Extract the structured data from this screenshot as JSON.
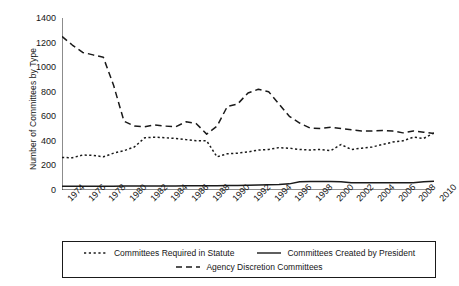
{
  "chart_data": {
    "type": "line",
    "title": "",
    "xlabel": "",
    "ylabel": "Number of Committees by Type",
    "ylim": [
      0,
      1400
    ],
    "ytick_step": 200,
    "yticks": [
      0,
      200,
      400,
      600,
      800,
      1000,
      1200,
      1400
    ],
    "xlim": [
      1974,
      2010
    ],
    "x": [
      1974,
      1975,
      1976,
      1977,
      1978,
      1979,
      1980,
      1981,
      1982,
      1983,
      1984,
      1985,
      1986,
      1987,
      1988,
      1989,
      1990,
      1991,
      1992,
      1993,
      1994,
      1995,
      1996,
      1997,
      1998,
      1999,
      2000,
      2001,
      2002,
      2003,
      2004,
      2005,
      2006,
      2007,
      2008,
      2009,
      2010
    ],
    "xtick_labels": [
      "1974",
      "1976",
      "1978",
      "1980",
      "1982",
      "1984",
      "1986",
      "1988",
      "1990",
      "1992",
      "1994",
      "1996",
      "1998",
      "2000",
      "2002",
      "2004",
      "2006",
      "2008",
      "2010"
    ],
    "xtick_label_years": [
      1974,
      1976,
      1978,
      1980,
      1982,
      1984,
      1986,
      1988,
      1990,
      1992,
      1994,
      1996,
      1998,
      2000,
      2002,
      2004,
      2006,
      2008,
      2010
    ],
    "xtick_minor_years": [
      1974,
      1975,
      1976,
      1977,
      1978,
      1979,
      1980,
      1981,
      1982,
      1983,
      1984,
      1985,
      1986,
      1987,
      1988,
      1989,
      1990,
      1991,
      1992,
      1993,
      1994,
      1995,
      1996,
      1997,
      1998,
      1999,
      2000,
      2001,
      2002,
      2003,
      2004,
      2005,
      2006,
      2007,
      2008,
      2009,
      2010
    ],
    "grid": false,
    "legend_position": "below",
    "series": [
      {
        "name": "Committees Required in Statute",
        "style": "dotted",
        "color": "#1a1a1a",
        "values": [
          265,
          262,
          285,
          282,
          270,
          300,
          320,
          350,
          425,
          430,
          425,
          420,
          410,
          400,
          400,
          270,
          295,
          300,
          310,
          325,
          330,
          345,
          340,
          330,
          325,
          330,
          320,
          370,
          330,
          340,
          350,
          370,
          390,
          400,
          430,
          420,
          465
        ]
      },
      {
        "name": "Committees Created by President",
        "style": "solid",
        "color": "#1a1a1a",
        "values": [
          30,
          30,
          30,
          30,
          30,
          30,
          32,
          32,
          32,
          33,
          33,
          33,
          34,
          34,
          34,
          35,
          36,
          37,
          38,
          40,
          42,
          45,
          50,
          68,
          70,
          70,
          70,
          68,
          60,
          58,
          58,
          58,
          58,
          58,
          60,
          68,
          72
        ]
      },
      {
        "name": "Agency Discretion Committees",
        "style": "dashed",
        "color": "#1a1a1a",
        "values": [
          1250,
          1180,
          1120,
          1100,
          1080,
          850,
          560,
          520,
          515,
          530,
          520,
          515,
          555,
          540,
          455,
          520,
          680,
          700,
          790,
          820,
          800,
          700,
          600,
          545,
          505,
          500,
          510,
          500,
          490,
          480,
          480,
          485,
          480,
          465,
          480,
          470,
          460
        ]
      }
    ]
  },
  "legend": {
    "items": [
      {
        "label": "Committees Required in Statute",
        "style": "dotted"
      },
      {
        "label": "Committees Created by President",
        "style": "solid"
      },
      {
        "label": "Agency Discretion Committees",
        "style": "dashed"
      }
    ]
  },
  "axis": {
    "y_title": "Number of Committees by Type"
  }
}
